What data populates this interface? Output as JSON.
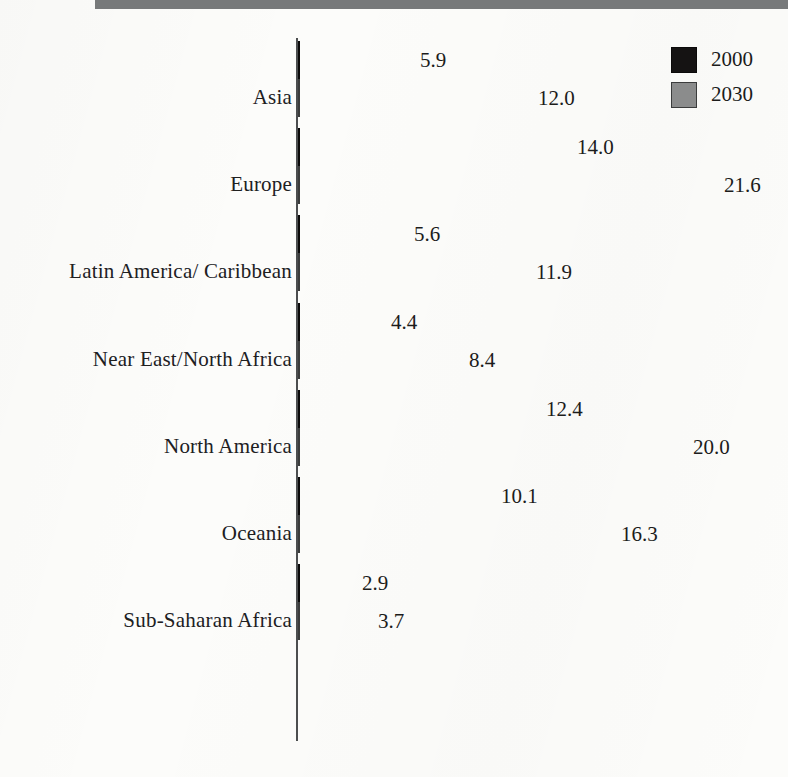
{
  "chart_data": {
    "type": "bar",
    "orientation": "horizontal",
    "title": "",
    "subtitle": "",
    "xlabel": "",
    "ylabel": "",
    "grid": false,
    "axis": {
      "value_axis_visible": false,
      "category_axis_visible": true,
      "xlim": [
        0,
        21.6
      ],
      "tick_labels": []
    },
    "legend": {
      "position": "top-right",
      "entries": [
        {
          "name": "2000",
          "color": "#151313"
        },
        {
          "name": "2030",
          "color": "#8b8c8c"
        }
      ]
    },
    "categories": [
      "Asia",
      "Europe",
      "Latin America/ Caribbean",
      "Near East/North Africa",
      "North America",
      "Oceania",
      "Sub-Saharan Africa"
    ],
    "series": [
      {
        "name": "2000",
        "color": "#151313",
        "values": [
          5.9,
          14.0,
          5.6,
          4.4,
          12.4,
          10.1,
          2.9
        ],
        "value_labels": [
          "5.9",
          "14.0",
          "5.6",
          "4.4",
          "12.4",
          "10.1",
          "2.9"
        ]
      },
      {
        "name": "2030",
        "color": "#8b8c8c",
        "values": [
          12.0,
          21.6,
          11.9,
          8.4,
          20.0,
          16.3,
          3.7
        ],
        "value_labels": [
          "12.0",
          "21.6",
          "11.9",
          "8.4",
          "20.0",
          "16.3",
          "3.7"
        ]
      }
    ],
    "colors": {
      "series_2000": "#151313",
      "series_2030": "#8b8c8c",
      "axis": "#4c4e4f",
      "header_rule": "#77797a",
      "page_background": "#fcfcfa",
      "text": "#1c1c1b"
    }
  }
}
